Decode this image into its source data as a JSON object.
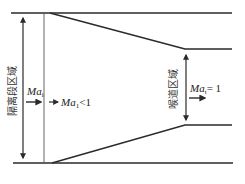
{
  "diagram": {
    "labels": {
      "isolation_region": "隔离段区域",
      "throat_region": "喉道区域",
      "mach_inlet_symbol": "Ma",
      "mach_inlet_sub": "i",
      "mach_after_symbol": "Ma",
      "mach_after_sub": "1",
      "mach_after_relation": "<1",
      "mach_throat_symbol": "Ma",
      "mach_throat_sub": "t",
      "mach_throat_relation": "= 1"
    },
    "colors": {
      "line": "#2a2a2a",
      "text": "#222222",
      "background": "#ffffff"
    }
  }
}
